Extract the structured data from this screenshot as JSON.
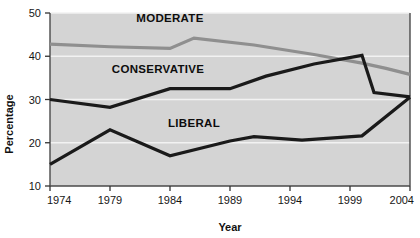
{
  "chart_data": {
    "type": "line",
    "title": "",
    "xlabel": "Year",
    "ylabel": "Percentage",
    "xlim": [
      1974,
      2004
    ],
    "ylim": [
      10,
      50
    ],
    "grid": true,
    "grid_color": "#f2f2f2",
    "plot_background": "#d4d4d4",
    "figure_background": "#ffffff",
    "legend_position": "inline-labels",
    "x_ticks": [
      1974,
      1979,
      1984,
      1989,
      1994,
      1999,
      2004
    ],
    "y_ticks": [
      10,
      20,
      30,
      40,
      50
    ],
    "series": [
      {
        "name": "MODERATE",
        "color": "#8f8f8f",
        "label_x": 1984,
        "label_y": 48.0,
        "x": [
          1974,
          1979,
          1984,
          1986,
          1991,
          1996,
          2000,
          2002,
          2004
        ],
        "values": [
          42.8,
          42.2,
          41.8,
          44.2,
          42.6,
          40.4,
          38.4,
          37.2,
          35.8
        ]
      },
      {
        "name": "CONSERVATIVE",
        "color": "#1a1a1a",
        "label_x": 1983,
        "label_y": 36.2,
        "x": [
          1974,
          1979,
          1984,
          1989,
          1992,
          1996,
          2000,
          2001,
          2004
        ],
        "values": [
          30.0,
          28.2,
          32.5,
          32.5,
          35.4,
          38.2,
          40.2,
          31.6,
          30.6
        ]
      },
      {
        "name": "LIBERAL",
        "color": "#1a1a1a",
        "label_x": 1986,
        "label_y": 23.6,
        "x": [
          1974,
          1979,
          1984,
          1989,
          1991,
          1995,
          2000,
          2004
        ],
        "values": [
          15.0,
          23.0,
          17.0,
          20.4,
          21.4,
          20.6,
          21.6,
          30.5
        ]
      }
    ]
  }
}
